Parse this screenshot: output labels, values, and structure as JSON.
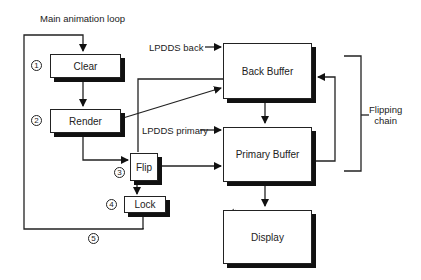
{
  "title": "Main animation loop",
  "steps": [
    {
      "num": "1",
      "label": "Clear"
    },
    {
      "num": "2",
      "label": "Render"
    },
    {
      "num": "3",
      "label": "Flip"
    },
    {
      "num": "4",
      "label": "Lock"
    },
    {
      "num": "5",
      "label": ""
    }
  ],
  "buffers": {
    "back": {
      "label": "Back Buffer",
      "pointer": "LPDDS back"
    },
    "primary": {
      "label": "Primary Buffer",
      "pointer": "LPDDS primary"
    },
    "display": {
      "label": "Display"
    }
  },
  "flipping_chain": {
    "line1": "Flipping",
    "line2": "chain"
  }
}
